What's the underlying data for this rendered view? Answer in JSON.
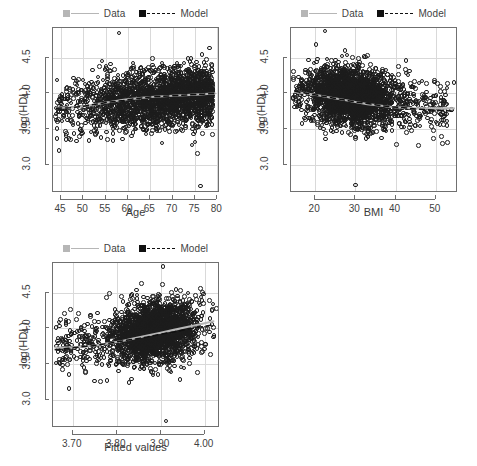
{
  "figure": {
    "width": 477,
    "height": 466,
    "background": "#ffffff",
    "layout": "2x2 grid, bottom-right cell empty"
  },
  "legend": {
    "data_label": "Data",
    "model_label": "Model",
    "data_color": "#b6b6b6",
    "model_color": "#101010",
    "data_line_style": "solid",
    "model_line_style": "dashed",
    "position": "above panel, centered"
  },
  "chart_data": [
    {
      "type": "scatter",
      "id": "panel-age",
      "title": "",
      "xlabel": "Age",
      "ylabel": "log(HDL)",
      "xlim": [
        43.2,
        80.6
      ],
      "ylim": [
        2.6,
        4.92
      ],
      "xticks": [
        45,
        50,
        55,
        60,
        65,
        70,
        75,
        80
      ],
      "xticklabels": [
        "45",
        "50",
        "55",
        "60",
        "65",
        "70",
        "75",
        "80"
      ],
      "yticks": [
        3.0,
        3.5,
        4.0,
        4.5
      ],
      "yticklabels": [
        "3.0",
        "3.5",
        "4.0",
        "4.5"
      ],
      "grid": true,
      "legend": [
        "Data",
        "Model"
      ],
      "series": [
        {
          "name": "Data",
          "kind": "loess-trend",
          "color": "#b6b6b6",
          "x": [
            44.0,
            47.0,
            50.0,
            53.0,
            56.0,
            59.0,
            62.0,
            65.0,
            68.0,
            71.0,
            74.0,
            77.0,
            79.5
          ],
          "y": [
            3.8,
            3.8,
            3.82,
            3.85,
            3.88,
            3.91,
            3.93,
            3.95,
            3.96,
            3.97,
            3.98,
            3.99,
            4.0
          ]
        },
        {
          "name": "Model",
          "kind": "fit-line",
          "color": "#101010",
          "style": "dashed",
          "x": [
            44.0,
            47.0,
            50.0,
            53.0,
            56.0,
            59.0,
            62.0,
            65.0,
            68.0,
            71.0,
            74.0,
            77.0,
            79.5
          ],
          "y": [
            3.79,
            3.8,
            3.82,
            3.85,
            3.88,
            3.9,
            3.93,
            3.95,
            3.96,
            3.97,
            3.98,
            3.99,
            4.0
          ]
        }
      ],
      "scatter_description": "Dense open-circle cloud spanning ages 50-80, centred near log(HDL) 3.9, thinning sharply below age 50."
    },
    {
      "type": "scatter",
      "id": "panel-bmi",
      "title": "",
      "xlabel": "BMI",
      "ylabel": "log(HDL)",
      "xlim": [
        14.0,
        55.5
      ],
      "ylim": [
        2.6,
        4.92
      ],
      "xticks": [
        20,
        30,
        40,
        50
      ],
      "xticklabels": [
        "20",
        "30",
        "40",
        "50"
      ],
      "yticks": [
        3.0,
        3.5,
        4.0,
        4.5
      ],
      "yticklabels": [
        "3.0",
        "3.5",
        "4.0",
        "4.5"
      ],
      "grid": true,
      "legend": [
        "Data",
        "Model"
      ],
      "series": [
        {
          "name": "Data",
          "kind": "loess-trend",
          "color": "#b6b6b6",
          "x": [
            15.0,
            18.0,
            21.0,
            24.0,
            27.0,
            30.0,
            33.0,
            36.0,
            39.0,
            42.0,
            45.0,
            48.0,
            51.0,
            54.5
          ],
          "y": [
            4.02,
            4.0,
            3.97,
            3.94,
            3.91,
            3.88,
            3.85,
            3.83,
            3.81,
            3.8,
            3.79,
            3.79,
            3.79,
            3.79
          ]
        },
        {
          "name": "Model",
          "kind": "fit-line",
          "color": "#101010",
          "style": "dashed",
          "x": [
            15.0,
            18.0,
            21.0,
            24.0,
            27.0,
            30.0,
            33.0,
            36.0,
            39.0,
            42.0,
            45.0,
            48.0,
            51.0,
            54.5
          ],
          "y": [
            4.03,
            4.0,
            3.97,
            3.94,
            3.91,
            3.88,
            3.86,
            3.83,
            3.81,
            3.8,
            3.78,
            3.77,
            3.76,
            3.75
          ]
        }
      ],
      "scatter_description": "Dense elliptical open-circle cloud centred near BMI 29 and log(HDL) 3.9, tapering to sparse points beyond BMI 45; one low outlier near BMI 30, log(HDL) 2.7."
    },
    {
      "type": "scatter",
      "id": "panel-fitted",
      "title": "",
      "xlabel": "Fitted values",
      "ylabel": "log(HDL)",
      "xlim": [
        3.655,
        4.035
      ],
      "ylim": [
        2.6,
        4.92
      ],
      "xticks": [
        3.7,
        3.8,
        3.9,
        4.0
      ],
      "xticklabels": [
        "3.70",
        "3.80",
        "3.90",
        "4.00"
      ],
      "yticks": [
        3.0,
        3.5,
        4.0,
        4.5
      ],
      "yticklabels": [
        "3.0",
        "3.5",
        "4.0",
        "4.5"
      ],
      "grid": true,
      "legend": [
        "Data",
        "Model"
      ],
      "series": [
        {
          "name": "Data",
          "kind": "loess-trend",
          "color": "#b6b6b6",
          "x": [
            3.66,
            3.69,
            3.72,
            3.75,
            3.78,
            3.81,
            3.84,
            3.87,
            3.9,
            3.93,
            3.96,
            3.99,
            4.02
          ],
          "y": [
            3.73,
            3.73,
            3.74,
            3.76,
            3.79,
            3.82,
            3.86,
            3.9,
            3.94,
            3.98,
            4.02,
            4.06,
            4.1
          ]
        },
        {
          "name": "Model",
          "kind": "fit-line",
          "color": "#101010",
          "style": "dashed",
          "x": [
            3.66,
            3.69,
            3.72,
            3.75,
            3.78,
            3.81,
            3.84,
            3.87,
            3.9,
            3.93,
            3.96,
            3.99,
            4.02
          ],
          "y": [
            3.7,
            3.72,
            3.74,
            3.76,
            3.79,
            3.82,
            3.85,
            3.88,
            3.92,
            3.95,
            3.99,
            4.02,
            4.05
          ]
        }
      ],
      "scatter_description": "Dense open-circle cloud rising left-to-right, concentrated between fitted values 3.80 and 3.98; sparse tail at low fitted values; one low outlier near 3.91, log(HDL) 2.7."
    }
  ]
}
